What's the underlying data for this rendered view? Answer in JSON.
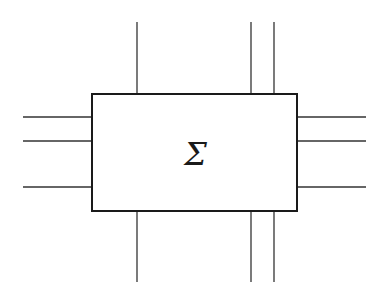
{
  "diagram": {
    "type": "block-diagram",
    "block": {
      "label": "Σ",
      "x": 92,
      "y": 94,
      "width": 205,
      "height": 117,
      "stroke": "#1a1a1a",
      "stroke_width": 2
    },
    "line_color": "#333333",
    "line_width": 1.3,
    "ports": {
      "top": [
        {
          "x": 137,
          "y1": 22,
          "y2": 94
        },
        {
          "x": 251,
          "y1": 22,
          "y2": 94
        },
        {
          "x": 274,
          "y1": 22,
          "y2": 94
        }
      ],
      "bottom": [
        {
          "x": 137,
          "y1": 211,
          "y2": 282
        },
        {
          "x": 251,
          "y1": 211,
          "y2": 282
        },
        {
          "x": 274,
          "y1": 211,
          "y2": 282
        }
      ],
      "left": [
        {
          "y": 117,
          "x1": 23,
          "x2": 92
        },
        {
          "y": 141,
          "x1": 23,
          "x2": 92
        },
        {
          "y": 187,
          "x1": 23,
          "x2": 92
        }
      ],
      "right": [
        {
          "y": 117,
          "x1": 297,
          "x2": 366
        },
        {
          "y": 141,
          "x1": 297,
          "x2": 366
        },
        {
          "y": 187,
          "x1": 297,
          "x2": 366
        }
      ]
    }
  }
}
